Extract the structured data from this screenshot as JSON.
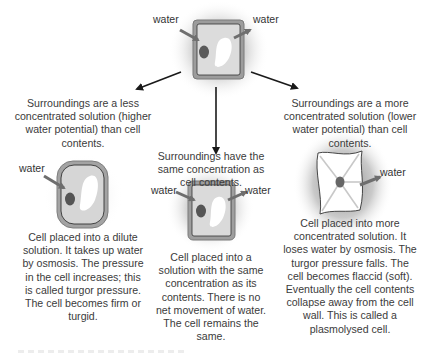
{
  "diagram": {
    "top_cell": {
      "label_in": "water",
      "label_out": "water"
    },
    "branches": [
      {
        "id": "dilute",
        "surroundings": "Surroundings are a less concentrated solution (higher water potential) than cell contents.",
        "surroundings_lines": [
          "Surroundings are a less",
          "concentrated solution (higher",
          "water potential) than cell",
          "contents."
        ],
        "water_labels": [
          "water"
        ],
        "description_lines": [
          "Cell placed into a dilute",
          "solution. It takes up water",
          "by osmosis. The pressure",
          "in the cell increases; this",
          "is called turgor pressure.",
          "The cell becomes firm or",
          "turgid."
        ]
      },
      {
        "id": "same",
        "surroundings_lines": [
          "Surroundings have the",
          "same concentration as",
          "cell contents."
        ],
        "water_labels": [
          "water",
          "water"
        ],
        "description_lines": [
          "Cell placed into a",
          "solution with the same",
          "concentration as its",
          "contents. There is no",
          "net movement of water.",
          "The cell remains the",
          "same."
        ]
      },
      {
        "id": "concentrated",
        "surroundings_lines": [
          "Surroundings are a more",
          "concentrated solution (lower",
          "water potential) than cell",
          "contents."
        ],
        "water_labels": [
          "water"
        ],
        "description_lines": [
          "Cell placed into more",
          "concentrated solution. It",
          "loses water by osmosis. The",
          "turgor pressure falls. The",
          "cell becomes flaccid (soft).",
          "Eventually the cell contents",
          "collapse away from the cell",
          "wall. This is called a",
          "plasmolysed cell."
        ]
      }
    ],
    "colors": {
      "cell_wall": "#8a8a8a",
      "cytoplasm": "#d9d9d9",
      "nucleus": "#5a5a5a",
      "vacuole": "#ffffff",
      "arrow": "#1a1a1a",
      "water_arrow": "#6e6e6e",
      "text": "#3b3b3b"
    }
  }
}
